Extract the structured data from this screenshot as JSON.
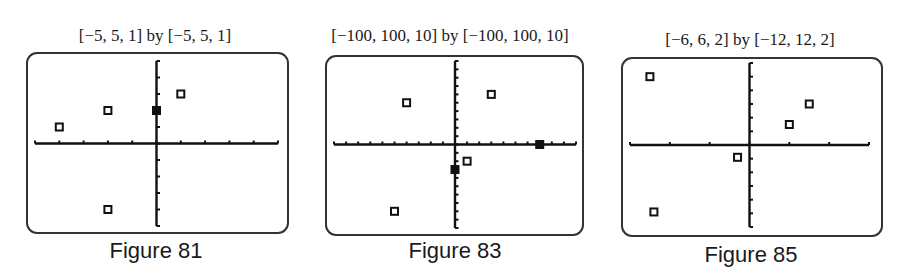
{
  "figures": [
    {
      "window_label": "[−5, 5, 1] by [−5, 5, 1]",
      "caption": "Figure 81"
    },
    {
      "window_label": "[−100, 100, 10] by [−100, 100, 10]",
      "caption": "Figure 83"
    },
    {
      "window_label": "[−6, 6, 2] by [−12, 12, 2]",
      "caption": "Figure 85"
    }
  ],
  "chart_data": [
    {
      "type": "scatter",
      "title": "[−5, 5, 1] by [−5, 5, 1]",
      "caption": "Figure 81",
      "xlim": [
        -5,
        5
      ],
      "xscl": 1,
      "ylim": [
        -5,
        5
      ],
      "yscl": 1,
      "grid": false,
      "points": [
        {
          "x": -4,
          "y": 1
        },
        {
          "x": -2,
          "y": 2
        },
        {
          "x": 0,
          "y": 2
        },
        {
          "x": 1,
          "y": 3
        },
        {
          "x": -2,
          "y": -4
        }
      ]
    },
    {
      "type": "scatter",
      "title": "[−100, 100, 10] by [−100, 100, 10]",
      "caption": "Figure 83",
      "xlim": [
        -100,
        100
      ],
      "xscl": 10,
      "ylim": [
        -100,
        100
      ],
      "yscl": 10,
      "grid": false,
      "points": [
        {
          "x": -40,
          "y": 50
        },
        {
          "x": 30,
          "y": 60
        },
        {
          "x": 70,
          "y": 0
        },
        {
          "x": 10,
          "y": -20
        },
        {
          "x": 0,
          "y": -30
        },
        {
          "x": -50,
          "y": -80
        }
      ]
    },
    {
      "type": "scatter",
      "title": "[−6, 6, 2] by [−12, 12, 2]",
      "caption": "Figure 85",
      "xlim": [
        -6,
        6
      ],
      "xscl": 2,
      "ylim": [
        -12,
        12
      ],
      "yscl": 2,
      "grid": false,
      "points": [
        {
          "x": -5,
          "y": 10
        },
        {
          "x": 3,
          "y": 6
        },
        {
          "x": 2,
          "y": 3
        },
        {
          "x": -0.6,
          "y": -1.8
        },
        {
          "x": -4.8,
          "y": -9.8
        }
      ]
    }
  ]
}
